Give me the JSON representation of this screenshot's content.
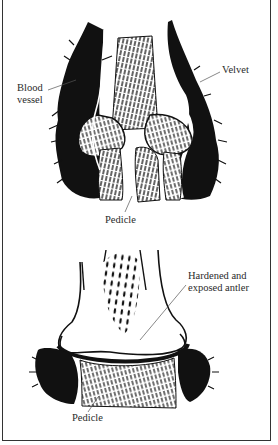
{
  "figure": {
    "top_panel": {
      "state": "velvet",
      "labels": {
        "blood_vessel_line1": "Blood",
        "blood_vessel_line2": "vessel",
        "velvet": "Velvet",
        "pedicle": "Pedicle"
      }
    },
    "bottom_panel": {
      "state": "hardened",
      "labels": {
        "hardened_line1": "Hardened and",
        "hardened_line2": "exposed antler",
        "pedicle": "Pedicle"
      }
    },
    "colors": {
      "ink": "#111111",
      "paper": "#ffffff",
      "border": "#333333"
    }
  }
}
